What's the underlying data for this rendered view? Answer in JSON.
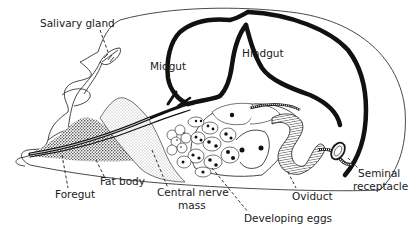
{
  "diagram": {
    "labels": {
      "salivary_gland": "Salivary gland",
      "midgut": "Midgut",
      "hindgut": "Hindgut",
      "foregut": "Foregut",
      "fat_body": "Fat body",
      "central_nerve_mass_line1": "Central nerve",
      "central_nerve_mass_line2": "mass",
      "developing_eggs": "Developing eggs",
      "oviduct": "Oviduct",
      "seminal_receptacle_line1": "Seminal",
      "seminal_receptacle_line2": "receptacle"
    },
    "colors": {
      "ink": "#1a1a1a",
      "background": "#ffffff",
      "stipple_dense": "#555555",
      "stipple_light": "#bbbbbb"
    }
  }
}
